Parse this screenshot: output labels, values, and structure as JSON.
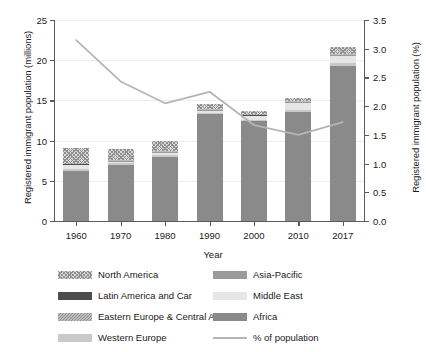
{
  "chart_data": {
    "type": "bar",
    "title": "",
    "subtitle": "",
    "xlabel": "Year",
    "ylabel": "Registered immigrant population (millions)",
    "ylabel_right": "Registered immigrant population (%)",
    "categories": [
      "1960",
      "1970",
      "1980",
      "1990",
      "2000",
      "2010",
      "2017"
    ],
    "ylim": [
      0,
      25
    ],
    "yticks": [
      "0",
      "5",
      "10",
      "15",
      "20",
      "25"
    ],
    "ylim_right": [
      0,
      3.5
    ],
    "yticks_right": [
      "0.0",
      "0.5",
      "1.0",
      "1.5",
      "2.0",
      "2.5",
      "3.0",
      "3.5"
    ],
    "grid": true,
    "legend_position": "bottom",
    "stacked": true,
    "series": [
      {
        "name": "Africa",
        "color": "#8a8a8a",
        "pattern": "solid",
        "values": [
          6.2,
          7.0,
          8.0,
          13.3,
          12.4,
          13.6,
          19.3
        ]
      },
      {
        "name": "Western Europe",
        "color": "#c9c9c9",
        "pattern": "solid",
        "values": [
          0.25,
          0.18,
          0.2,
          0.18,
          0.2,
          0.25,
          0.3
        ]
      },
      {
        "name": "Middle East",
        "color": "#e6e6e6",
        "pattern": "solid",
        "values": [
          0.55,
          0.25,
          0.3,
          0.25,
          0.45,
          0.9,
          0.95
        ]
      },
      {
        "name": "Asia-Pacific",
        "color": "#9a9a9a",
        "pattern": "solid",
        "values": [
          0.1,
          0.08,
          0.1,
          0.1,
          0.1,
          0.1,
          0.15
        ]
      },
      {
        "name": "Latin America and Car",
        "color": "#4d4d4d",
        "pattern": "solid",
        "values": [
          0.05,
          0.04,
          0.05,
          0.05,
          0.05,
          0.05,
          0.05
        ]
      },
      {
        "name": "Eastern Europe & Central Asia",
        "color": "#bdbdbd",
        "pattern": "diagonal",
        "values": [
          0.05,
          0.05,
          0.05,
          0.05,
          0.05,
          0.05,
          0.05
        ]
      },
      {
        "name": "North America",
        "color": "#d8d8d8",
        "pattern": "checkered",
        "values": [
          1.9,
          1.3,
          1.2,
          0.67,
          0.45,
          0.35,
          0.8
        ]
      }
    ],
    "line_series": {
      "name": "% of population",
      "color": "#b5b5b5",
      "axis": "right",
      "values": [
        3.15,
        2.43,
        2.05,
        2.25,
        1.67,
        1.5,
        1.72
      ]
    },
    "bar_totals": [
      9.1,
      8.9,
      9.9,
      14.6,
      13.7,
      15.3,
      21.6
    ]
  },
  "legend": {
    "left_column": [
      "North America",
      "Latin America and Car",
      "Eastern Europe & Central Asia",
      "Western Europe"
    ],
    "right_column": [
      "Asia-Pacific",
      "Middle East",
      "Africa",
      "% of population"
    ]
  }
}
